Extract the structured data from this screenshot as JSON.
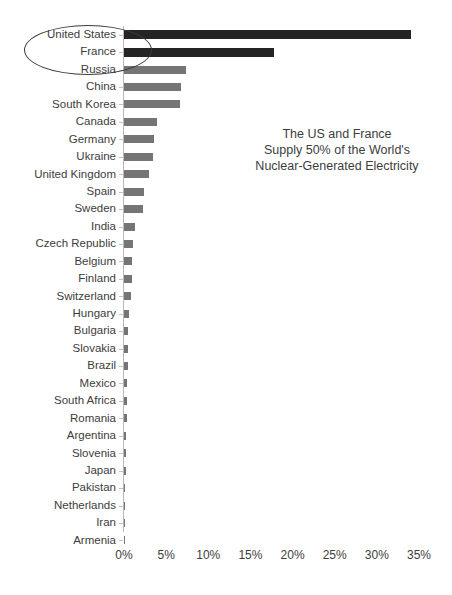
{
  "chart_data": {
    "type": "bar",
    "orientation": "horizontal",
    "title": "",
    "xlabel": "",
    "ylabel": "",
    "xlim": [
      0,
      35
    ],
    "xticks": [
      "0%",
      "5%",
      "10%",
      "15%",
      "20%",
      "25%",
      "30%",
      "35%"
    ],
    "xtick_values": [
      0,
      5,
      10,
      15,
      20,
      25,
      30,
      35
    ],
    "grid": false,
    "legend": "none",
    "value_unit": "percent",
    "categories": [
      "United States",
      "France",
      "Russia",
      "China",
      "South Korea",
      "Canada",
      "Germany",
      "Ukraine",
      "United Kingdom",
      "Spain",
      "Sweden",
      "India",
      "Czech Republic",
      "Belgium",
      "Finland",
      "Switzerland",
      "Hungary",
      "Bulgaria",
      "Slovakia",
      "Brazil",
      "Mexico",
      "South Africa",
      "Romania",
      "Argentina",
      "Slovenia",
      "Japan",
      "Pakistan",
      "Netherlands",
      "Iran",
      "Armenia"
    ],
    "values": [
      34.0,
      17.8,
      7.4,
      6.8,
      6.6,
      3.9,
      3.5,
      3.4,
      3.0,
      2.4,
      2.3,
      1.3,
      1.1,
      1.0,
      0.9,
      0.85,
      0.55,
      0.5,
      0.5,
      0.45,
      0.4,
      0.35,
      0.35,
      0.25,
      0.2,
      0.18,
      0.15,
      0.15,
      0.12,
      0.1
    ],
    "highlighted": [
      "United States",
      "France"
    ],
    "colors": {
      "bar": "#757575",
      "bar_highlighted": "#242424",
      "axis": "#b9b9b9",
      "text": "#3d3d3d",
      "background": "#ffffff"
    },
    "annotations": [
      {
        "name": "callout-ellipse",
        "shape": "ellipse",
        "targets": [
          "United States",
          "France"
        ]
      },
      {
        "name": "callout-text",
        "lines": [
          "The US and France",
          "Supply 50% of the World's",
          "Nuclear-Generated Electricity"
        ]
      }
    ]
  },
  "annotation": {
    "line1": "The US and France",
    "line2": "Supply 50% of the World's",
    "line3": "Nuclear-Generated Electricity"
  }
}
